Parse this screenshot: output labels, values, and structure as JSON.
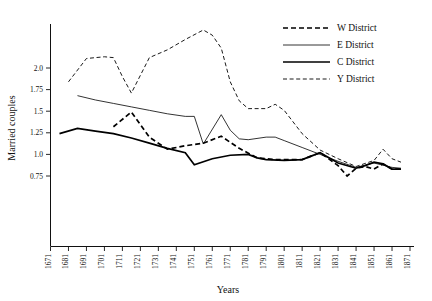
{
  "chart_data": {
    "type": "line",
    "title": "",
    "xlabel": "Years",
    "ylabel": "Married couples",
    "xlim": [
      1671,
      1871
    ],
    "ylim": [
      0.25,
      2.55
    ],
    "grid": false,
    "legend_position": "top-right",
    "x_tick_labels": [
      "1671",
      "1681",
      "1691",
      "1701",
      "1711",
      "1721",
      "1731",
      "1741",
      "1751",
      "1761",
      "1771",
      "1781",
      "1791",
      "1801",
      "1811",
      "1821",
      "1831",
      "1841",
      "1851",
      "1861",
      "1871"
    ],
    "y_tick_labels": [
      "0.75",
      "1.0",
      "1.25",
      "1.5",
      "1.75",
      "2.0"
    ],
    "y_tick_values": [
      0.75,
      1.0,
      1.25,
      1.5,
      1.75,
      2.0
    ],
    "series": [
      {
        "name": "W District",
        "style": "dashed-bold",
        "x": [
          1706,
          1716,
          1726,
          1736,
          1746,
          1756,
          1766,
          1776,
          1786,
          1791,
          1796,
          1801,
          1811,
          1816,
          1821,
          1831,
          1836,
          1841,
          1846,
          1851,
          1856,
          1861,
          1866
        ],
        "y": [
          1.32,
          1.49,
          1.2,
          1.06,
          1.1,
          1.13,
          1.21,
          1.07,
          0.96,
          0.95,
          0.94,
          0.94,
          0.94,
          0.98,
          1.02,
          0.87,
          0.75,
          0.84,
          0.86,
          0.83,
          0.89,
          0.83,
          0.83
        ]
      },
      {
        "name": "E District",
        "style": "solid-thin",
        "x": [
          1686,
          1696,
          1706,
          1716,
          1726,
          1736,
          1746,
          1751,
          1756,
          1766,
          1771,
          1776,
          1781,
          1791,
          1796,
          1801,
          1811,
          1821,
          1831,
          1841,
          1851,
          1861,
          1866
        ],
        "y": [
          1.68,
          1.63,
          1.59,
          1.55,
          1.51,
          1.47,
          1.44,
          1.44,
          1.12,
          1.46,
          1.28,
          1.18,
          1.17,
          1.2,
          1.2,
          1.16,
          1.08,
          1.0,
          0.92,
          0.85,
          0.9,
          0.85,
          0.84
        ]
      },
      {
        "name": "C District",
        "style": "solid-bold",
        "x": [
          1676,
          1686,
          1696,
          1706,
          1716,
          1726,
          1736,
          1746,
          1751,
          1761,
          1771,
          1781,
          1786,
          1791,
          1801,
          1811,
          1816,
          1821,
          1831,
          1841,
          1846,
          1851,
          1856,
          1861,
          1866
        ],
        "y": [
          1.24,
          1.3,
          1.27,
          1.24,
          1.19,
          1.13,
          1.07,
          1.02,
          0.88,
          0.95,
          0.99,
          1.0,
          0.96,
          0.94,
          0.93,
          0.94,
          0.98,
          1.02,
          0.9,
          0.84,
          0.87,
          0.91,
          0.89,
          0.83,
          0.83
        ]
      },
      {
        "name": "Y District",
        "style": "dashed-thin",
        "x": [
          1681,
          1691,
          1701,
          1706,
          1711,
          1716,
          1726,
          1736,
          1746,
          1756,
          1761,
          1766,
          1771,
          1776,
          1781,
          1791,
          1796,
          1801,
          1811,
          1821,
          1831,
          1841,
          1851,
          1856,
          1861,
          1866
        ],
        "y": [
          1.84,
          2.11,
          2.13,
          2.12,
          1.9,
          1.71,
          2.12,
          2.21,
          2.33,
          2.44,
          2.38,
          2.23,
          1.84,
          1.62,
          1.53,
          1.53,
          1.58,
          1.51,
          1.24,
          1.05,
          0.95,
          0.86,
          0.93,
          1.06,
          0.95,
          0.91
        ]
      }
    ]
  },
  "legend": {
    "entries": [
      {
        "label": "W District"
      },
      {
        "label": "E District"
      },
      {
        "label": "C District"
      },
      {
        "label": "Y District"
      }
    ]
  },
  "axes": {
    "y_title": "Married couples",
    "x_title": "Years"
  }
}
